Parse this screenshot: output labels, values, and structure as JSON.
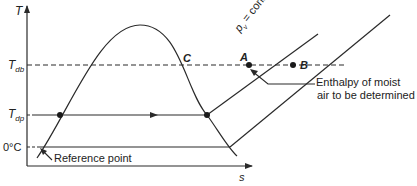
{
  "axes": {
    "y_label": "T",
    "x_label": "s"
  },
  "levels": {
    "t_db": {
      "main": "T",
      "sub": "db"
    },
    "t_dp": {
      "main": "T",
      "sub": "dp"
    },
    "zero": "0°C"
  },
  "points": {
    "a": "A",
    "b": "B",
    "c": "C"
  },
  "isobar_label": "p",
  "isobar_sub": "v",
  "isobar_rest": " = const.",
  "annotations": {
    "enthalpy_line1": "Enthalpy of moist",
    "enthalpy_line2": "air to be determined",
    "reference_point": "Reference point"
  },
  "colors": {
    "line": "#2a2a2a",
    "background": "#ffffff"
  }
}
